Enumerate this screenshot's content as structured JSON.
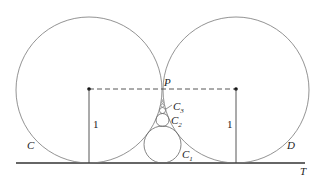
{
  "diagram": {
    "type": "geometry",
    "labels": {
      "circle_left": "C",
      "circle_right": "D",
      "tangent_point": "P",
      "line": "T",
      "small_1": "C",
      "small_1_sub": "1",
      "small_2": "C",
      "small_2_sub": "2",
      "small_3": "C",
      "small_3_sub": "3",
      "radius_left": "1",
      "radius_right": "1"
    },
    "colors": {
      "stroke": "#555555",
      "text": "#222222"
    }
  }
}
